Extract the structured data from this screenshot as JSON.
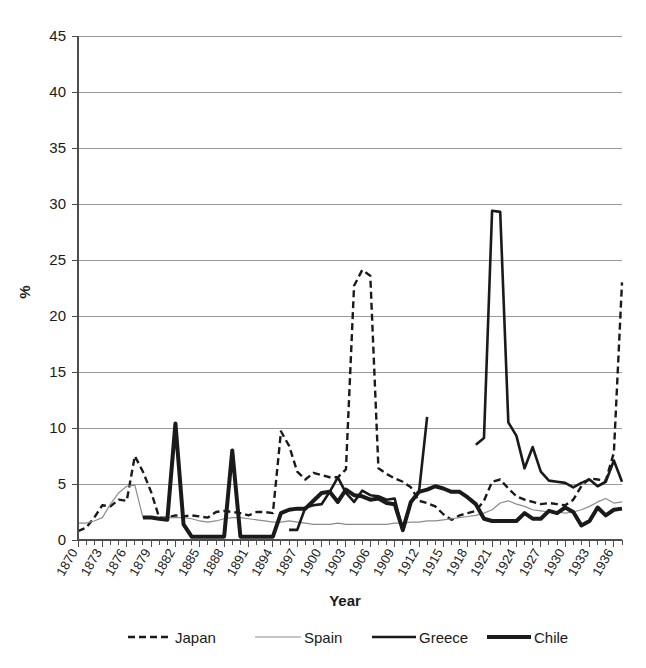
{
  "chart_data": {
    "type": "line",
    "title": "",
    "xlabel": "Year",
    "ylabel": "%",
    "ylim": [
      0,
      45
    ],
    "xlim": [
      1870,
      1937
    ],
    "ytick_step": 5,
    "yticks": [
      "0",
      "5",
      "10",
      "15",
      "20",
      "25",
      "30",
      "35",
      "40",
      "45"
    ],
    "xtick_step": 3,
    "xticks": [
      "1870",
      "1873",
      "1876",
      "1879",
      "1882",
      "1885",
      "1888",
      "1891",
      "1894",
      "1897",
      "1900",
      "1903",
      "1906",
      "1909",
      "1912",
      "1915",
      "1918",
      "1921",
      "1924",
      "1927",
      "1930",
      "1933",
      "1936"
    ],
    "grid": "horizontal",
    "legend_position": "bottom",
    "series": [
      {
        "name": "Japan",
        "style": "dashed",
        "color": "#1a1a1a",
        "width": 2.4,
        "dash": "7,4",
        "x": [
          1870,
          1871,
          1872,
          1873,
          1874,
          1875,
          1876,
          1877,
          1878,
          1879,
          1880,
          1881,
          1882,
          1883,
          1884,
          1885,
          1886,
          1887,
          1888,
          1889,
          1890,
          1891,
          1892,
          1893,
          1894,
          1895,
          1896,
          1897,
          1898,
          1899,
          1900,
          1901,
          1902,
          1903,
          1904,
          1905,
          1906,
          1907,
          1908,
          1909,
          1910,
          1911,
          1912,
          1913,
          1914,
          1915,
          1916,
          1917,
          1918,
          1919,
          1920,
          1921,
          1922,
          1923,
          1924,
          1925,
          1926,
          1927,
          1928,
          1929,
          1930,
          1931,
          1932,
          1933,
          1934,
          1935,
          1936,
          1937
        ],
        "y": [
          0.8,
          1.1,
          2.0,
          3.1,
          3.0,
          3.6,
          3.5,
          7.5,
          6.1,
          4.3,
          2.0,
          2.0,
          2.2,
          2.1,
          2.2,
          2.1,
          2.0,
          2.5,
          2.6,
          2.5,
          2.4,
          2.2,
          2.5,
          2.5,
          2.4,
          9.7,
          8.4,
          6.1,
          5.4,
          6.0,
          5.8,
          5.6,
          5.6,
          6.3,
          22.7,
          24.1,
          23.6,
          6.4,
          5.9,
          5.5,
          5.2,
          4.7,
          3.5,
          3.3,
          3.0,
          2.3,
          1.8,
          2.2,
          2.4,
          2.6,
          3.5,
          5.2,
          5.4,
          4.6,
          3.9,
          3.6,
          3.4,
          3.2,
          3.3,
          3.2,
          3.1,
          3.6,
          4.8,
          5.5,
          5.4,
          5.3,
          7.8,
          23.0
        ]
      },
      {
        "name": "Spain",
        "style": "solid-thin",
        "color": "#8c8c8c",
        "width": 1.2,
        "dash": "none",
        "x": [
          1870,
          1871,
          1872,
          1873,
          1874,
          1875,
          1876,
          1877,
          1878,
          1879,
          1880,
          1881,
          1882,
          1883,
          1884,
          1885,
          1886,
          1887,
          1888,
          1889,
          1890,
          1891,
          1892,
          1893,
          1894,
          1895,
          1896,
          1897,
          1898,
          1899,
          1900,
          1901,
          1902,
          1903,
          1904,
          1905,
          1906,
          1907,
          1908,
          1909,
          1910,
          1911,
          1912,
          1913,
          1914,
          1915,
          1916,
          1917,
          1918,
          1919,
          1920,
          1921,
          1922,
          1923,
          1924,
          1925,
          1926,
          1927,
          1928,
          1929,
          1930,
          1931,
          1932,
          1933,
          1934,
          1935,
          1936,
          1937
        ],
        "y": [
          1.5,
          1.5,
          1.7,
          2.0,
          3.2,
          4.2,
          4.8,
          4.9,
          2.0,
          2.0,
          2.0,
          2.0,
          2.0,
          2.0,
          1.9,
          1.7,
          1.6,
          1.7,
          1.9,
          2.0,
          2.0,
          1.9,
          1.8,
          1.7,
          1.6,
          1.6,
          1.7,
          1.6,
          1.5,
          1.4,
          1.4,
          1.4,
          1.5,
          1.4,
          1.4,
          1.4,
          1.4,
          1.4,
          1.4,
          1.5,
          1.5,
          1.6,
          1.6,
          1.7,
          1.7,
          1.8,
          1.9,
          2.0,
          2.1,
          2.2,
          2.4,
          2.7,
          3.3,
          3.5,
          3.2,
          3.0,
          2.7,
          2.6,
          2.5,
          2.5,
          2.4,
          2.5,
          2.7,
          3.0,
          3.4,
          3.7,
          3.3,
          3.4
        ]
      },
      {
        "name": "Greece",
        "style": "solid-medium",
        "color": "#1a1a1a",
        "width": 2.6,
        "dash": "none",
        "segments": [
          {
            "x": [
              1896,
              1897,
              1898,
              1899,
              1900,
              1901,
              1902,
              1903,
              1904,
              1905,
              1906,
              1907,
              1908,
              1909,
              1910,
              1911,
              1912,
              1913
            ],
            "y": [
              0.9,
              0.9,
              2.9,
              3.1,
              3.2,
              4.3,
              5.6,
              4.2,
              3.4,
              4.4,
              4.0,
              3.9,
              3.6,
              3.7,
              0.8,
              3.4,
              4.3,
              11.0
            ]
          },
          {
            "x": [
              1919,
              1920,
              1921,
              1922,
              1923,
              1924,
              1925,
              1926,
              1927,
              1928,
              1929,
              1930,
              1931,
              1932,
              1933,
              1934,
              1935,
              1936,
              1937
            ],
            "y": [
              8.5,
              9.1,
              29.4,
              29.3,
              10.5,
              9.3,
              6.4,
              8.3,
              6.1,
              5.3,
              5.2,
              5.1,
              4.7,
              5.1,
              5.4,
              4.8,
              5.2,
              7.1,
              5.2
            ]
          }
        ],
        "x": [],
        "y": []
      },
      {
        "name": "Chile",
        "style": "solid-thick",
        "color": "#1a1a1a",
        "width": 4.0,
        "dash": "none",
        "x": [
          1878,
          1879,
          1880,
          1881,
          1882,
          1883,
          1884,
          1885,
          1886,
          1887,
          1888,
          1889,
          1890,
          1891,
          1892,
          1893,
          1894,
          1895,
          1896,
          1897,
          1898,
          1899,
          1900,
          1901,
          1902,
          1903,
          1904,
          1905,
          1906,
          1907,
          1908,
          1909,
          1910,
          1911,
          1912,
          1913,
          1914,
          1915,
          1916,
          1917,
          1918,
          1919,
          1920,
          1921,
          1922,
          1923,
          1924,
          1925,
          1926,
          1927,
          1928,
          1929,
          1930,
          1931,
          1932,
          1933,
          1934,
          1935,
          1936,
          1937
        ],
        "y": [
          2.0,
          2.0,
          1.9,
          1.8,
          10.4,
          1.4,
          0.3,
          0.3,
          0.3,
          0.3,
          0.3,
          8.0,
          0.3,
          0.3,
          0.3,
          0.3,
          0.3,
          2.4,
          2.7,
          2.8,
          2.8,
          3.5,
          4.2,
          4.3,
          3.4,
          4.5,
          4.0,
          3.9,
          3.6,
          3.7,
          3.3,
          3.2,
          0.9,
          3.4,
          4.3,
          4.5,
          4.8,
          4.6,
          4.3,
          4.3,
          3.8,
          3.2,
          1.9,
          1.7,
          1.7,
          1.7,
          1.7,
          2.4,
          1.9,
          1.9,
          2.6,
          2.4,
          2.9,
          2.5,
          1.3,
          1.7,
          2.9,
          2.2,
          2.7,
          2.8
        ]
      }
    ]
  },
  "legend": {
    "items": [
      {
        "label": "Japan"
      },
      {
        "label": "Spain"
      },
      {
        "label": "Greece"
      },
      {
        "label": "Chile"
      }
    ]
  }
}
